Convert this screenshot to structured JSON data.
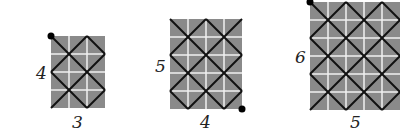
{
  "colors": {
    "cell": "#8a8a8a",
    "gridline": "#f0f0f0",
    "path": "#111111",
    "dot": "#000000"
  },
  "cell_size": 18,
  "grids": [
    {
      "width": 3,
      "height": 4,
      "width_label": "3",
      "height_label": "4",
      "x": 51,
      "y": 36,
      "start_corner": "top-left"
    },
    {
      "width": 4,
      "height": 5,
      "width_label": "4",
      "height_label": "5",
      "x": 170,
      "y": 19,
      "start_corner": "bottom-right"
    },
    {
      "width": 5,
      "height": 6,
      "width_label": "5",
      "height_label": "6",
      "x": 310,
      "y": 2,
      "start_corner": "top-left"
    }
  ]
}
